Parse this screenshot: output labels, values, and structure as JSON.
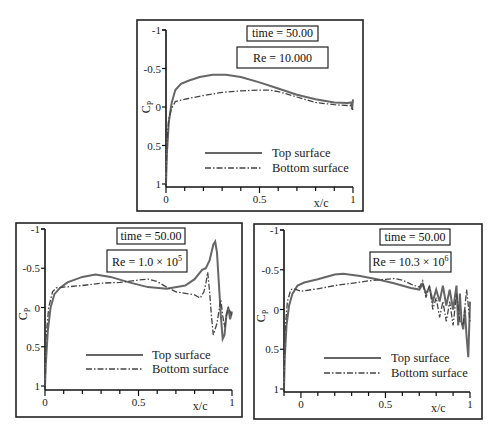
{
  "figure": {
    "legend": {
      "top": "Top surface",
      "bottom": "Bottom surface"
    },
    "xlabel": "x/c",
    "ylabel": "C",
    "ylabel_sub": "P"
  },
  "chart_data": [
    {
      "type": "line",
      "title": "time = 50.00",
      "subtitle": "Re = 10.000",
      "xlabel": "x/c",
      "ylabel": "Cp",
      "xlim": [
        0,
        1
      ],
      "ylim": [
        1,
        -1
      ],
      "y_inverted": true,
      "xticks": [
        0,
        0.5,
        1
      ],
      "xtick_labels": [
        "0",
        "0.5",
        "1"
      ],
      "yticks": [
        -1,
        -0.5,
        0,
        0.5,
        1
      ],
      "ytick_labels": [
        "-1",
        "-0.5",
        "0",
        "0.5",
        "1"
      ],
      "legend": [
        "Top surface",
        "Bottom surface"
      ],
      "legend_position": "bottom-right",
      "series": [
        {
          "name": "Top surface",
          "x": [
            0,
            0.005,
            0.015,
            0.03,
            0.05,
            0.08,
            0.12,
            0.18,
            0.25,
            0.32,
            0.4,
            0.5,
            0.6,
            0.7,
            0.8,
            0.9,
            0.97,
            0.99,
            0.995,
            1.0
          ],
          "y": [
            1.0,
            0.6,
            0.2,
            -0.05,
            -0.22,
            -0.3,
            -0.34,
            -0.39,
            -0.42,
            -0.42,
            -0.39,
            -0.32,
            -0.24,
            -0.16,
            -0.1,
            -0.06,
            -0.05,
            -0.06,
            0.03,
            -0.1
          ]
        },
        {
          "name": "Bottom surface",
          "x": [
            0,
            0.005,
            0.015,
            0.03,
            0.05,
            0.08,
            0.12,
            0.2,
            0.3,
            0.4,
            0.5,
            0.55,
            0.6,
            0.7,
            0.8,
            0.9,
            0.97,
            0.99,
            1.0
          ],
          "y": [
            1.0,
            0.45,
            0.15,
            0.02,
            -0.07,
            -0.09,
            -0.11,
            -0.15,
            -0.19,
            -0.21,
            -0.22,
            -0.22,
            -0.2,
            -0.13,
            -0.06,
            -0.03,
            -0.02,
            -0.02,
            0.04
          ]
        }
      ]
    },
    {
      "type": "line",
      "title": "time = 50.00",
      "subtitle": "Re = 1.0 × 10^5",
      "subtitle_base": "Re = 1.0 × 10",
      "subtitle_exp": "5",
      "xlabel": "x/c",
      "ylabel": "Cp",
      "xlim": [
        0,
        1
      ],
      "ylim": [
        1,
        -1
      ],
      "y_inverted": true,
      "xticks": [
        0,
        0.5,
        1
      ],
      "xtick_labels": [
        "0",
        "0.5",
        "1"
      ],
      "yticks": [
        -1,
        -0.5,
        0,
        0.5,
        1
      ],
      "ytick_labels": [
        "-1",
        "-0.5",
        "0",
        "0.5",
        "1"
      ],
      "legend": [
        "Top surface",
        "Bottom surface"
      ],
      "legend_position": "bottom-right",
      "series": [
        {
          "name": "Top surface",
          "x": [
            0,
            0.005,
            0.015,
            0.03,
            0.05,
            0.08,
            0.12,
            0.2,
            0.27,
            0.35,
            0.45,
            0.55,
            0.65,
            0.75,
            0.8,
            0.84,
            0.86,
            0.88,
            0.9,
            0.91,
            0.92,
            0.93,
            0.94,
            0.95,
            0.96,
            0.97,
            0.98,
            0.99,
            1.0
          ],
          "y": [
            1.0,
            0.7,
            0.3,
            0.0,
            -0.17,
            -0.25,
            -0.32,
            -0.39,
            -0.42,
            -0.39,
            -0.32,
            -0.26,
            -0.24,
            -0.28,
            -0.36,
            -0.48,
            -0.5,
            -0.6,
            -0.8,
            -0.84,
            -0.7,
            -0.3,
            0.1,
            0.4,
            0.35,
            0.1,
            0.0,
            0.15,
            0.05
          ]
        },
        {
          "name": "Bottom surface",
          "x": [
            0,
            0.005,
            0.02,
            0.04,
            0.06,
            0.1,
            0.2,
            0.3,
            0.4,
            0.5,
            0.55,
            0.6,
            0.65,
            0.7,
            0.75,
            0.8,
            0.83,
            0.85,
            0.86,
            0.87,
            0.88,
            0.89,
            0.9,
            0.92,
            0.94,
            0.95,
            0.96,
            0.97,
            0.98,
            1.0
          ],
          "y": [
            1.0,
            0.4,
            0.0,
            -0.2,
            -0.25,
            -0.26,
            -0.28,
            -0.31,
            -0.32,
            -0.35,
            -0.36,
            -0.33,
            -0.26,
            -0.2,
            -0.18,
            -0.16,
            -0.12,
            -0.2,
            -0.3,
            -0.45,
            -0.2,
            0.1,
            0.35,
            0.2,
            -0.1,
            0.1,
            0.25,
            0.1,
            0.0,
            0.1
          ]
        }
      ]
    },
    {
      "type": "line",
      "title": "time = 50.00",
      "subtitle": "Re = 10.3 × 10^6",
      "subtitle_base": "Re = 10.3 × 10",
      "subtitle_exp": "6",
      "xlabel": "x/c",
      "ylabel": "Cp",
      "xlim": [
        -0.1,
        1
      ],
      "ylim": [
        1,
        -1
      ],
      "y_inverted": true,
      "xticks": [
        0,
        0.5,
        1
      ],
      "xtick_labels": [
        "0",
        "0.5",
        "1"
      ],
      "yticks": [
        -1,
        -0.5,
        0,
        0.5,
        1
      ],
      "ytick_labels": [
        "-1",
        "-0.5",
        "0",
        "0.5",
        "1"
      ],
      "legend": [
        "Top surface",
        "Bottom surface"
      ],
      "legend_position": "bottom-right",
      "series": [
        {
          "name": "Top surface",
          "x": [
            -0.1,
            -0.095,
            -0.085,
            -0.07,
            -0.05,
            -0.02,
            0.02,
            0.1,
            0.2,
            0.25,
            0.35,
            0.45,
            0.55,
            0.65,
            0.7,
            0.72,
            0.74,
            0.76,
            0.78,
            0.8,
            0.82,
            0.84,
            0.86,
            0.88,
            0.9,
            0.92,
            0.93,
            0.94,
            0.95,
            0.96,
            0.97,
            0.98,
            0.99,
            1.0
          ],
          "y": [
            1.0,
            0.6,
            0.2,
            -0.05,
            -0.2,
            -0.3,
            -0.34,
            -0.38,
            -0.44,
            -0.45,
            -0.42,
            -0.38,
            -0.33,
            -0.27,
            -0.25,
            -0.32,
            -0.2,
            -0.28,
            -0.1,
            -0.25,
            -0.1,
            -0.3,
            -0.05,
            -0.25,
            0.0,
            -0.3,
            0.2,
            -0.2,
            0.15,
            0.25,
            0.0,
            0.35,
            0.6,
            -0.1
          ]
        },
        {
          "name": "Bottom surface",
          "x": [
            -0.1,
            -0.095,
            -0.08,
            -0.06,
            -0.04,
            0.0,
            0.1,
            0.2,
            0.3,
            0.4,
            0.5,
            0.55,
            0.6,
            0.65,
            0.7,
            0.72,
            0.74,
            0.76,
            0.78,
            0.8,
            0.82,
            0.84,
            0.86,
            0.88,
            0.9,
            0.92,
            0.94,
            0.96,
            0.98,
            1.0
          ],
          "y": [
            1.0,
            0.3,
            -0.1,
            -0.25,
            -0.26,
            -0.23,
            -0.26,
            -0.3,
            -0.33,
            -0.36,
            -0.38,
            -0.39,
            -0.37,
            -0.32,
            -0.28,
            -0.36,
            -0.15,
            -0.3,
            0.0,
            -0.15,
            0.1,
            -0.1,
            0.15,
            -0.1,
            0.2,
            -0.2,
            0.15,
            0.2,
            -0.25,
            0.15
          ]
        }
      ]
    }
  ]
}
